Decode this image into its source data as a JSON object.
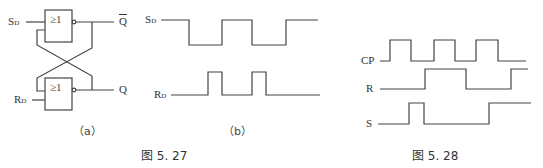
{
  "figure_527": {
    "caption": "图 5. 27",
    "circuit_a": {
      "caption": "（a）",
      "gate_top_symbol": "≥1",
      "gate_bottom_symbol": "≥1",
      "input_top": {
        "main": "S",
        "sub": "D"
      },
      "input_bottom": {
        "main": "R",
        "sub": "D"
      },
      "output_top": "Q",
      "output_bottom": "Q"
    },
    "waveform_b": {
      "caption": "（b）",
      "signal_1": {
        "main": "S",
        "sub": "D"
      },
      "signal_2": {
        "main": "R",
        "sub": "D"
      }
    }
  },
  "figure_528": {
    "caption": "图 5. 28",
    "signals": [
      "CP",
      "R",
      "S"
    ]
  },
  "colors": {
    "line": "#444444",
    "background": "#ffffff"
  }
}
